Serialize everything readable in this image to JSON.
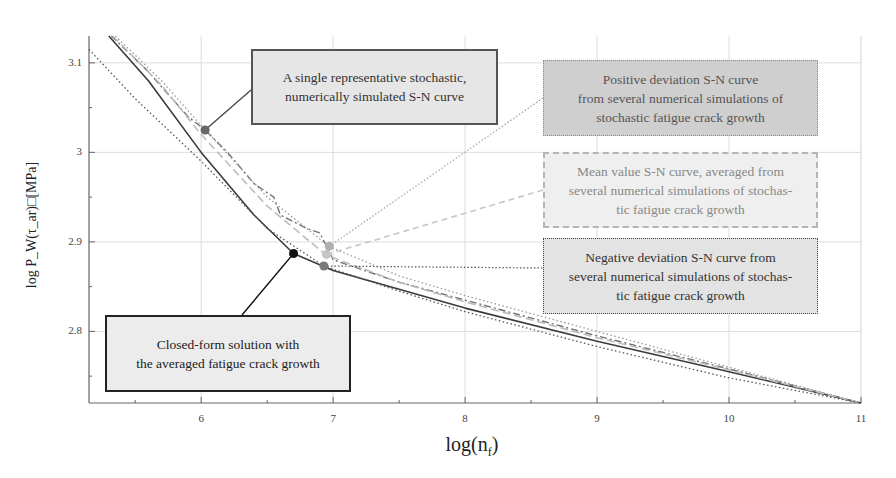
{
  "chart_data": {
    "type": "line",
    "title": "",
    "xlabel": "log(n_f)",
    "ylabel": "log P_W(τ_ar) [MPa]",
    "xlim": [
      5.15,
      11
    ],
    "ylim": [
      2.72,
      3.13
    ],
    "xticks": [
      6,
      7,
      8,
      9,
      10,
      11
    ],
    "yticks": [
      2.8,
      2.9,
      3.0,
      3.1
    ],
    "grid": true,
    "legend": "annotation callouts",
    "series": [
      {
        "name": "Closed-form solution with the averaged fatigue crack growth",
        "style": "solid dark",
        "x": [
          5.3,
          5.6,
          6.0,
          6.4,
          6.7,
          7.0,
          7.5,
          8.0,
          9.0,
          10.0,
          11.0
        ],
        "y": [
          3.13,
          3.08,
          3.0,
          2.93,
          2.887,
          2.868,
          2.847,
          2.826,
          2.789,
          2.755,
          2.72
        ]
      },
      {
        "name": "A single representative stochastic, numerically simulated S-N curve",
        "style": "dash-dot dark gray",
        "x": [
          5.32,
          5.6,
          5.9,
          6.03,
          6.2,
          6.4,
          6.55,
          6.6,
          6.8,
          6.9,
          7.0,
          7.5,
          8.0,
          9.0,
          10.0,
          11.0
        ],
        "y": [
          3.13,
          3.09,
          3.04,
          3.025,
          3.0,
          2.965,
          2.95,
          2.93,
          2.915,
          2.91,
          2.88,
          2.855,
          2.835,
          2.795,
          2.758,
          2.72
        ]
      },
      {
        "name": "Positive deviation S-N curve from several numerical simulations of stochastic fatigue crack growth",
        "style": "dotted gray",
        "x": [
          5.35,
          5.7,
          6.0,
          6.5,
          6.97,
          7.5,
          8.0,
          9.0,
          10.0,
          11.0
        ],
        "y": [
          3.13,
          3.08,
          3.03,
          2.95,
          2.895,
          2.862,
          2.84,
          2.8,
          2.76,
          2.72
        ]
      },
      {
        "name": "Mean value S-N curve, averaged from several numerical simulations of stochastic fatigue crack growth",
        "style": "dashed light gray",
        "x": [
          5.33,
          5.7,
          6.0,
          6.5,
          6.95,
          7.5,
          8.0,
          9.0,
          10.0,
          11.0
        ],
        "y": [
          3.13,
          3.075,
          3.02,
          2.94,
          2.885,
          2.855,
          2.833,
          2.793,
          2.757,
          2.72
        ]
      },
      {
        "name": "Negative deviation S-N curve from several numerical simulations of stochastic fatigue crack growth",
        "style": "dotted dark",
        "x": [
          5.15,
          5.5,
          6.0,
          6.5,
          6.93,
          7.5,
          8.0,
          9.0,
          10.0,
          11.0
        ],
        "y": [
          3.115,
          3.06,
          2.99,
          2.915,
          2.873,
          2.845,
          2.822,
          2.783,
          2.748,
          2.72
        ]
      }
    ],
    "annotations": [
      {
        "text": "A single representative stochastic, numerically simulated S-N curve",
        "point": [
          6.03,
          3.025
        ]
      },
      {
        "text": "Positive deviation S-N curve from several numerical simulations of stochastic fatigue crack growth",
        "point": [
          6.97,
          2.895
        ]
      },
      {
        "text": "Mean value S-N curve, averaged from several numerical simulations of stochastic fatigue crack growth",
        "point": [
          6.95,
          2.886
        ]
      },
      {
        "text": "Negative deviation S-N curve from several numerical simulations of stochastic fatigue crack growth",
        "point": [
          6.93,
          2.873
        ]
      },
      {
        "text": "Closed-form solution with the averaged fatigue crack growth",
        "point": [
          6.7,
          2.887
        ]
      }
    ]
  },
  "axes": {
    "xlabel_main": "log(n",
    "xlabel_sub": "f",
    "xlabel_close": ")",
    "ylabel": "log P_W(τ_ar)□[MPa]",
    "xtick_labels": [
      "6",
      "7",
      "8",
      "9",
      "10",
      "11"
    ],
    "ytick_labels": [
      "3.1",
      "3",
      "2.9",
      "2.8"
    ]
  },
  "callouts": {
    "single": [
      "A single representative stochastic,",
      "numerically simulated S-N curve"
    ],
    "positive": [
      "Positive deviation S-N curve",
      "from several numerical simulations of",
      "stochastic fatigue crack growth"
    ],
    "mean": [
      "Mean value S-N curve, averaged  from",
      "several numerical simulations of stochas-",
      "tic fatigue crack growth"
    ],
    "negative": [
      "Negative deviation S-N curve from",
      "several numerical simulations of stochas-",
      "tic fatigue crack growth"
    ],
    "closed": [
      "Closed-form solution with",
      "the averaged fatigue crack growth"
    ]
  },
  "colors": {
    "closed_form": "#3a3a3a",
    "single": "#707070",
    "positive": "#9a9a9a",
    "mean": "#bdbdbd",
    "negative": "#555555",
    "grid": "#dddddd",
    "axis": "#666666"
  }
}
